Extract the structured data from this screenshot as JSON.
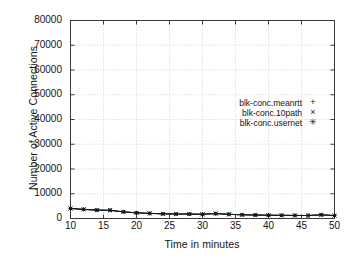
{
  "chart_data": {
    "type": "line",
    "title": "",
    "xlabel": "Time in minutes",
    "ylabel": "Number of Active Connections",
    "xlim": [
      10,
      50
    ],
    "ylim": [
      0,
      80000
    ],
    "grid": true,
    "legend_position": "center-right",
    "xticks": [
      10,
      15,
      20,
      25,
      30,
      35,
      40,
      45,
      50
    ],
    "xtick_labels": [
      "10",
      "15",
      "20",
      "25",
      "30",
      "35",
      "40",
      "45",
      "50"
    ],
    "yticks": [
      0,
      10000,
      20000,
      30000,
      40000,
      50000,
      60000,
      70000,
      80000
    ],
    "ytick_labels": [
      "0",
      "10000",
      "20000",
      "30000",
      "40000",
      "50000",
      "60000",
      "70000",
      "80000"
    ],
    "series": [
      {
        "name": "blk-conc.meanrtt",
        "marker": "+",
        "x": [
          10,
          12,
          14,
          16,
          18,
          20,
          22,
          24,
          26,
          28,
          30,
          32,
          34,
          36,
          38,
          40,
          42,
          44,
          46,
          48,
          50
        ],
        "values": [
          4100,
          3700,
          3400,
          3300,
          2700,
          2300,
          2100,
          1900,
          1800,
          1800,
          1750,
          1900,
          1700,
          1500,
          1400,
          1350,
          1300,
          1250,
          1200,
          1500,
          1200
        ]
      },
      {
        "name": "blk-conc.10path",
        "marker": "×",
        "x": [
          10,
          12,
          14,
          16,
          18,
          20,
          22,
          24,
          26,
          28,
          30,
          32,
          34,
          36,
          38,
          40,
          42,
          44,
          46,
          48,
          50
        ],
        "values": [
          4000,
          3650,
          3350,
          3250,
          2650,
          2250,
          2050,
          1850,
          1800,
          1750,
          1700,
          2100,
          1650,
          1500,
          1400,
          1300,
          1300,
          1200,
          1200,
          1450,
          1150
        ]
      },
      {
        "name": "blk-conc.usernet",
        "marker": "✳",
        "x": [
          10,
          12,
          14,
          16,
          18,
          20,
          22,
          24,
          26,
          28,
          30,
          32,
          34,
          36,
          38,
          40,
          42,
          44,
          46,
          48,
          50
        ],
        "values": [
          4050,
          3700,
          3400,
          3400,
          2700,
          2300,
          2050,
          1900,
          1800,
          1800,
          1700,
          1950,
          1700,
          1500,
          1400,
          1350,
          1250,
          1250,
          1200,
          1500,
          1200
        ]
      }
    ]
  },
  "colors": {
    "line": "#151515",
    "grid": "#bdbdbd",
    "frame": "#3a3a3a",
    "text": "#141414",
    "background": "#ffffff"
  }
}
